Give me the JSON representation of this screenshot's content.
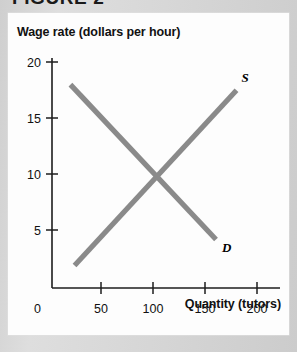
{
  "figure": {
    "title": "FIGURE 2"
  },
  "chart_data": {
    "type": "line",
    "title": "FIGURE 2",
    "xlabel": "Quantity (tutors)",
    "ylabel": "Wage rate (dollars per hour)",
    "xlim": [
      0,
      210
    ],
    "ylim": [
      0,
      21
    ],
    "xticks": [
      "0",
      "50",
      "100",
      "150",
      "200"
    ],
    "xtick_values": [
      0,
      50,
      100,
      150,
      200
    ],
    "yticks": [
      "0",
      "5",
      "10",
      "15",
      "20"
    ],
    "ytick_values": [
      0,
      5,
      10,
      15,
      20
    ],
    "grid": false,
    "legend": "inline-endpoint-labels",
    "series": [
      {
        "name": "S",
        "label": "S",
        "description": "Supply curve, upward sloping",
        "color": "#8a8a8a",
        "x": [
          22,
          180
        ],
        "y": [
          2,
          17.5
        ]
      },
      {
        "name": "D",
        "label": "D",
        "description": "Demand curve, downward sloping",
        "color": "#8a8a8a",
        "x": [
          18,
          160
        ],
        "y": [
          18,
          4.3
        ]
      }
    ],
    "annotations": [
      {
        "name": "equilibrium",
        "x": 100,
        "y": 10,
        "description": "Intersection of supply and demand"
      }
    ]
  }
}
